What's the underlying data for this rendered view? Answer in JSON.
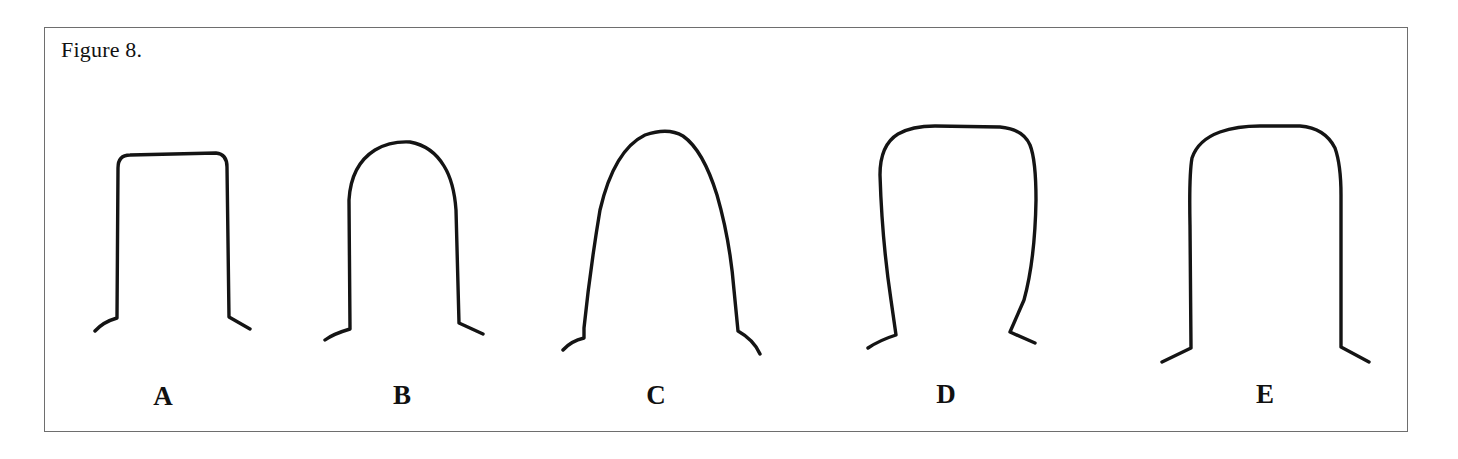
{
  "figure": {
    "caption": "Figure 8.",
    "border_color": "#6e6e6e",
    "stroke_color": "#141414",
    "shapes": [
      {
        "id": "A",
        "label": "A",
        "description": "flat-topped rectangular profile with squared shoulders, straight vertical sides, flared feet",
        "label_x": 163,
        "path": "M 95 331 Q 103 322 117 318 L 118 168 Q 118 155 130 155 L 216 153 Q 227 154 227 167 L 229 317 L 250 329"
      },
      {
        "id": "B",
        "label": "B",
        "description": "rounded semicircular top, straight vertical sides, flared feet",
        "label_x": 402,
        "path": "M 325 340 Q 333 334 350 329 L 349 200 Q 351 165 375 150 Q 390 141 410 142 Q 432 146 444 166 Q 454 182 456 210 L 459 323 L 483 334"
      },
      {
        "id": "C",
        "label": "C",
        "description": "tall parabolic arch tapering outward toward the base, flared feet",
        "label_x": 656,
        "path": "M 563 350 Q 571 341 584 338 L 584 328 Q 590 270 600 210 Q 614 150 645 135 Q 668 127 683 136 Q 703 150 717 195 Q 730 240 734 290 L 738 331 Q 754 340 760 354"
      },
      {
        "id": "D",
        "label": "D",
        "description": "wide rounded-square top with sides converging toward a narrower base, flared feet",
        "label_x": 946,
        "path": "M 868 348 Q 880 340 896 335 L 891 300 Q 882 240 880 175 Q 880 145 898 134 Q 912 126 935 126 L 1000 127 Q 1023 129 1030 145 Q 1036 160 1036 200 Q 1035 260 1024 300 L 1010 332 L 1035 343"
      },
      {
        "id": "E",
        "label": "E",
        "description": "wide rounded top with straight vertical sides and angled flared feet",
        "label_x": 1265,
        "path": "M 1162 362 L 1191 348 L 1190 225 Q 1189 175 1192 158 Q 1198 140 1220 132 Q 1237 126 1260 126 L 1300 126 Q 1325 128 1335 148 Q 1341 165 1341 195 L 1341 347 L 1369 362"
      }
    ]
  }
}
